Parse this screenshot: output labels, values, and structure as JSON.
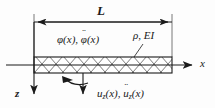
{
  "figure": {
    "type": "beam-schematic",
    "background_color": "#fdfdfd",
    "line_color": "#1a1a1a"
  },
  "dimension": {
    "length_label": "L",
    "extension_line_left_x": 34,
    "extension_line_right_x": 172,
    "dimension_line_y": 22
  },
  "beam": {
    "hatch_pattern": "cross-hatch-diamond",
    "left_x": 34,
    "right_x": 172,
    "top_y": 57,
    "bottom_y": 73,
    "material_label": "ρ, EI"
  },
  "axes": {
    "x_axis": {
      "label": "x",
      "direction": "right",
      "y": 65,
      "start_x": 6,
      "end_x": 196
    },
    "z_axis": {
      "label": "z",
      "direction": "down",
      "x": 34,
      "start_y": 22,
      "end_y": 98
    }
  },
  "dof": {
    "rotation": {
      "label_plain": "φ (x), φ (x)",
      "symbol": "φ",
      "arg": "(x)",
      "accel_dots": "¨",
      "comma": ", ",
      "marker": "curved-rotation-arrow"
    },
    "translation": {
      "label_plain": "u_z (x), ü_z (x)",
      "symbol": "u",
      "subscript": "z",
      "arg": "(x)",
      "accel_dots": "¨",
      "comma": ", ",
      "marker": "downward-force-arrow"
    }
  },
  "annotations": {
    "leader_line": {
      "from_x": 134,
      "from_y": 56,
      "to_x": 143,
      "to_y": 44
    }
  }
}
